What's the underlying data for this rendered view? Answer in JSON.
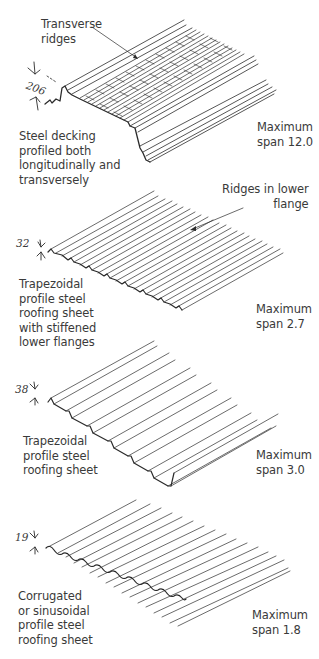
{
  "figure": {
    "panels": [
      {
        "id": "steel-decking",
        "description": "Steel decking\nprofiled both\nlongitudinally and\ntransversely",
        "span": "Maximum\nspan 12.0",
        "depth": "206",
        "callout": "Transverse\nridges"
      },
      {
        "id": "trapezoidal-stiffened",
        "description": "Trapezoidal\nprofile steel\nroofing sheet\nwith stiffened\nlower flanges",
        "span": "Maximum\nspan 2.7",
        "depth": "32",
        "callout": "Ridges in lower\nflange"
      },
      {
        "id": "trapezoidal",
        "description": "Trapezoidal\nprofile steel\nroofing sheet",
        "span": "Maximum\nspan 3.0",
        "depth": "38"
      },
      {
        "id": "corrugated",
        "description": "Corrugated\nor sinusoidal\nprofile steel\nroofing sheet",
        "span": "Maximum\nspan 1.8",
        "depth": "19"
      }
    ],
    "colors": {
      "line": "#2b2b2b",
      "text": "#3a3a3a",
      "background": "#ffffff"
    }
  }
}
